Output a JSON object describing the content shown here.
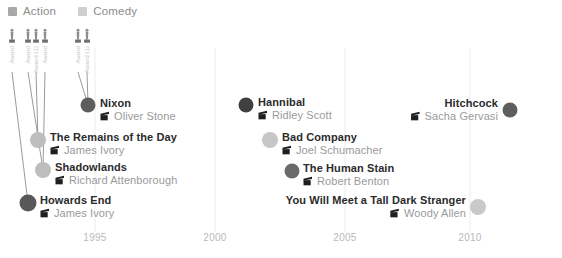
{
  "legend": {
    "items": [
      {
        "label": "Action",
        "color": "#a8a8a8"
      },
      {
        "label": "Comedy",
        "color": "#cfcfcf"
      }
    ]
  },
  "axis": {
    "ticks": [
      "1995",
      "2000",
      "2005",
      "2010"
    ],
    "tick_color": "#b9b9b9",
    "grid_color": "#ececec"
  },
  "awards": [
    {
      "caption": "Award",
      "x": 12
    },
    {
      "caption": "Award",
      "x": 28
    },
    {
      "caption": "Award (1)",
      "x": 36
    },
    {
      "caption": "Award",
      "x": 45
    },
    {
      "caption": "Award",
      "x": 78
    },
    {
      "caption": "Award (1)",
      "x": 87
    }
  ],
  "chart_data": {
    "type": "scatter",
    "title": "",
    "xlabel": "",
    "ylabel": "",
    "xlim": [
      1991,
      2013
    ],
    "grid": true,
    "legend_position": "top-left",
    "xticks": [
      1995,
      2000,
      2005,
      2010
    ],
    "series": [
      {
        "name": "Action",
        "color": "#5e5e5e"
      },
      {
        "name": "Comedy",
        "color": "#c6c6c6"
      }
    ],
    "points": [
      {
        "title": "Nixon",
        "director": "Oliver Stone",
        "series": "Action",
        "year": 1995,
        "color": "#5e5e5e",
        "px": 88,
        "py": 105,
        "r": 7.5,
        "align": "left",
        "label_x": 100,
        "label_y": 110
      },
      {
        "title": "The Remains of the Day",
        "director": "James Ivory",
        "series": "Comedy",
        "year": 1993,
        "color": "#bdbdbd",
        "px": 38,
        "py": 140,
        "r": 8,
        "align": "left",
        "label_x": 50,
        "label_y": 144
      },
      {
        "title": "Shadowlands",
        "director": "Richard Attenborough",
        "series": "Comedy",
        "year": 1993,
        "color": "#bdbdbd",
        "px": 43,
        "py": 170,
        "r": 8,
        "align": "left",
        "label_x": 55,
        "label_y": 174
      },
      {
        "title": "Howards End",
        "director": "James Ivory",
        "series": "Action",
        "year": 1992,
        "color": "#585858",
        "px": 28,
        "py": 203,
        "r": 8.5,
        "align": "left",
        "label_x": 40,
        "label_y": 207
      },
      {
        "title": "Hannibal",
        "director": "Ridley Scott",
        "series": "Action",
        "year": 2001,
        "color": "#404040",
        "px": 246,
        "py": 105,
        "r": 7.5,
        "align": "left",
        "label_x": 258,
        "label_y": 109
      },
      {
        "title": "Bad Company",
        "director": "Joel Schumacher",
        "series": "Comedy",
        "year": 2002,
        "color": "#c6c6c6",
        "px": 270,
        "py": 140,
        "r": 8,
        "align": "left",
        "label_x": 282,
        "label_y": 144
      },
      {
        "title": "The Human Stain",
        "director": "Robert Benton",
        "series": "Action",
        "year": 2003,
        "color": "#6a6a6a",
        "px": 292,
        "py": 171,
        "r": 7.5,
        "align": "left",
        "label_x": 303,
        "label_y": 175
      },
      {
        "title": "You Will Meet a Tall Dark Stranger",
        "director": "Woody Allen",
        "series": "Comedy",
        "year": 2010,
        "color": "#c9c9c9",
        "px": 478,
        "py": 207,
        "r": 8,
        "align": "right",
        "label_x": 466,
        "label_y": 207
      },
      {
        "title": "Hitchcock",
        "director": "Sacha Gervasi",
        "series": "Action",
        "year": 2012,
        "color": "#5e5e5e",
        "px": 510,
        "py": 110,
        "r": 7.5,
        "align": "right",
        "label_x": 498,
        "label_y": 110
      }
    ]
  }
}
